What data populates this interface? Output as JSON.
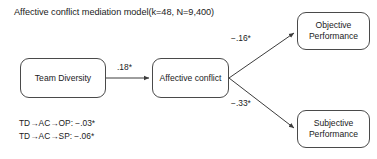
{
  "figure": {
    "title": "Affective conflict mediation model(k=48, N=9,400)",
    "line_color": "#4a4a4a",
    "text_color": "#1b1b1b",
    "background": "#ffffff"
  },
  "nodes": {
    "team_diversity": "Team Diversity",
    "affective_conflict": "Affective conflict",
    "objective_performance_line1": "Objective",
    "objective_performance_line2": "Performance",
    "subjective_performance_line1": "Subjective",
    "subjective_performance_line2": "Performance"
  },
  "paths": {
    "a_path_label": ".18*",
    "b1_path_label": "−.16*",
    "b2_path_label": "−.33*"
  },
  "indirect_effects": {
    "line1": "TD→AC→OP: −.03*",
    "line2": "TD→AC→SP: −.06*"
  }
}
